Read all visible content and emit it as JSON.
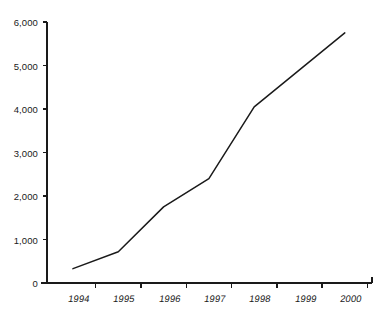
{
  "chart_data": {
    "type": "line",
    "title": "",
    "subtitle": "",
    "xlabel": "",
    "ylabel": "",
    "categories": [
      "1994",
      "1995",
      "1996",
      "1997",
      "1998",
      "1999",
      "2000"
    ],
    "x": [
      1994,
      1995,
      1996,
      1997,
      1998,
      1999,
      2000
    ],
    "values": [
      330,
      720,
      1750,
      2400,
      4050,
      4900,
      5750
    ],
    "series": [
      {
        "name": "",
        "values": [
          330,
          720,
          1750,
          2400,
          4050,
          4900,
          5750
        ]
      }
    ],
    "ylim": [
      0,
      6000
    ],
    "ytick_labels": [
      "0",
      "1,000",
      "2,000",
      "3,000",
      "4,000",
      "5,000",
      "6,000"
    ],
    "ytick_values": [
      0,
      1000,
      2000,
      3000,
      4000,
      5000,
      6000
    ],
    "xtick_labels": [
      "1994",
      "1995",
      "1996",
      "1997",
      "1998",
      "1999",
      "2000"
    ],
    "grid": false,
    "legend": false,
    "legend_position": "none",
    "annotations": [],
    "line_color": "#1a1a1a",
    "axis_color": "#1a1a1a",
    "background_color": "#ffffff",
    "markers": false
  },
  "axes": {
    "y_axis_name": "value-axis",
    "x_axis_name": "year-axis"
  }
}
